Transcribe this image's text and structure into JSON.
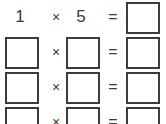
{
  "worksheet": {
    "operator_symbol": "×",
    "equals_symbol": "=",
    "border_color": "#3c3c3c",
    "text_color": "#3a3a3a",
    "background_color": "#ffffff",
    "rows": [
      {
        "index": 1,
        "operand_a": "1",
        "operand_a_is_box": false,
        "operand_b": "5",
        "operand_b_is_box": false,
        "answer": "",
        "answer_is_box": true
      },
      {
        "index": 2,
        "operand_a": "",
        "operand_a_is_box": true,
        "operand_b": "",
        "operand_b_is_box": true,
        "answer": "",
        "answer_is_box": true
      },
      {
        "index": 3,
        "operand_a": "",
        "operand_a_is_box": true,
        "operand_b": "",
        "operand_b_is_box": true,
        "answer": "",
        "answer_is_box": true
      },
      {
        "index": 4,
        "operand_a": "",
        "operand_a_is_box": true,
        "operand_b": "",
        "operand_b_is_box": true,
        "answer": "",
        "answer_is_box": true
      }
    ]
  }
}
